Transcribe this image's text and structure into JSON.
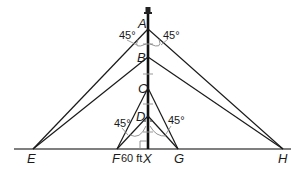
{
  "diagram": {
    "type": "geometry-figure",
    "colors": {
      "line": "#1a1a1a",
      "tower": "#111111",
      "ground": "#555555",
      "tick": "#999999"
    },
    "points": {
      "A": {
        "label": "A"
      },
      "B": {
        "label": "B"
      },
      "C": {
        "label": "C"
      },
      "D": {
        "label": "D"
      },
      "E": {
        "label": "E"
      },
      "F": {
        "label": "F"
      },
      "X": {
        "label": "X"
      },
      "G": {
        "label": "G"
      },
      "H": {
        "label": "H"
      }
    },
    "angles": {
      "top_left": "45°",
      "top_right": "45°",
      "bottom_left": "45°",
      "bottom_right": "45°"
    },
    "measurements": {
      "FX": "60 ft"
    },
    "segments": [
      "A-E",
      "A-H",
      "B-E",
      "B-H",
      "C-F",
      "C-G",
      "D-F",
      "D-G",
      "tower",
      "ground"
    ]
  }
}
